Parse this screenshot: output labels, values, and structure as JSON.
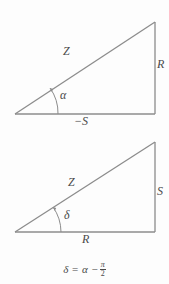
{
  "figure": {
    "background_color": "#fdfdfd",
    "stroke_color": "#8c8c8c",
    "text_color": "#4a4a4a",
    "top_triangle": {
      "name": "impedance-triangle-negative-reactance",
      "hypotenuse_label": "Z",
      "vertical_side_label": "R",
      "base_label": "−S",
      "angle_label": "α",
      "vertices": {
        "left": [
          15,
          114
        ],
        "bottom_right": [
          155,
          114
        ],
        "apex": [
          155,
          22
        ]
      }
    },
    "bottom_triangle": {
      "name": "impedance-triangle-rotated",
      "hypotenuse_label": "Z",
      "vertical_side_label": "S",
      "base_label": "R",
      "angle_label": "δ",
      "vertices": {
        "left": [
          15,
          232
        ],
        "bottom_right": [
          155,
          232
        ],
        "apex": [
          155,
          142
        ]
      }
    },
    "equation": {
      "lhs": "δ",
      "equals": "=",
      "term": "α",
      "operator": "−",
      "fraction_numerator": "π",
      "fraction_denominator": "2",
      "full_text": "δ = α − π/2"
    }
  }
}
